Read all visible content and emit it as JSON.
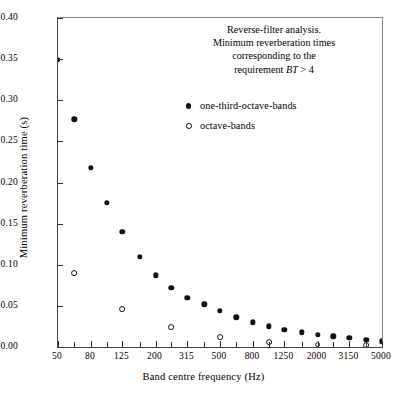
{
  "chart_data": {
    "type": "scatter",
    "title": "",
    "title_lines": [
      "Reverse-filter analysis.",
      "Minimum reverberation times",
      "corresponding to the",
      "requirement BT > 4"
    ],
    "annotation": {
      "line1": "Reverse-filter analysis.",
      "line2": "Minimum reverberation times",
      "line3": "corresponding to the",
      "line4_pre": "requirement ",
      "line4_italic": "BT",
      "line4_post": " > 4"
    },
    "xlabel": "Band centre frequency (Hz)",
    "ylabel": "Minimum reverberation time (s)",
    "xscale": "log",
    "xlim": [
      50,
      5000
    ],
    "ylim": [
      0.0,
      0.4
    ],
    "grid": false,
    "legend_position": "upper-center-inside",
    "xticklabels": [
      "50",
      "80",
      "125",
      "200",
      "315",
      "500",
      "800",
      "1250",
      "2000",
      "3150",
      "5000"
    ],
    "xtickvalues": [
      50,
      80,
      125,
      200,
      315,
      500,
      800,
      1250,
      2000,
      3150,
      5000
    ],
    "xminorticks": [
      63,
      100,
      160,
      250,
      400,
      630,
      1000,
      1600,
      2500,
      4000
    ],
    "yticklabels": [
      "0.00",
      "0.05",
      "0.10",
      "0.15",
      "0.20",
      "0.25",
      "0.30",
      "0.35",
      "0.40"
    ],
    "ytickvalues": [
      0.0,
      0.05,
      0.1,
      0.15,
      0.2,
      0.25,
      0.3,
      0.35,
      0.4
    ],
    "series": [
      {
        "name": "one-third-octave-bands",
        "marker": "filled-circle",
        "color": "#111111",
        "x": [
          50,
          63,
          80,
          100,
          125,
          160,
          200,
          250,
          315,
          400,
          500,
          630,
          800,
          1000,
          1250,
          1600,
          2000,
          2500,
          3150,
          4000,
          5000
        ],
        "y": [
          0.349,
          0.277,
          0.218,
          0.175,
          0.14,
          0.11,
          0.087,
          0.072,
          0.06,
          0.052,
          0.044,
          0.036,
          0.03,
          0.025,
          0.021,
          0.018,
          0.015,
          0.013,
          0.011,
          0.009,
          0.007
        ]
      },
      {
        "name": "octave-bands",
        "marker": "open-circle",
        "color": "#111111",
        "x": [
          63,
          125,
          250,
          500,
          1000,
          2000,
          4000
        ],
        "y": [
          0.09,
          0.046,
          0.024,
          0.012,
          0.006,
          0.003,
          0.002
        ]
      }
    ]
  },
  "legend": {
    "items": [
      {
        "label": "one-third-octave-bands",
        "marker": "filled-circle"
      },
      {
        "label": "octave-bands",
        "marker": "open-circle"
      }
    ]
  }
}
